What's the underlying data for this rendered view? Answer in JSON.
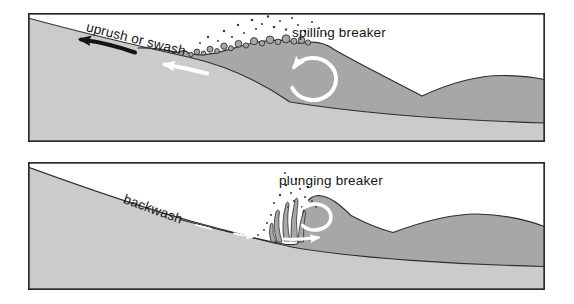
{
  "colors": {
    "background": "#ffffff",
    "water": "#a7a7a7",
    "sand": "#cbcbcb",
    "outline": "#2f2f2f",
    "frame": "#2b2b2b",
    "text": "#141414",
    "arrow_black": "#141414",
    "arrow_white": "#ffffff",
    "spray": "#3b3b3b"
  },
  "panels": [
    {
      "id": "spilling-breaker-panel",
      "flow_label": "uprush or swash",
      "breaker_label": "spilling breaker",
      "arrows": [
        "black-uprush-arrow-pointing-left",
        "white-swash-arrow-pointing-left",
        "white-orbital-circulation-arrow"
      ]
    },
    {
      "id": "plunging-breaker-panel",
      "flow_label": "backwash",
      "breaker_label": "plunging breaker",
      "arrows": [
        "white-backwash-dashes-pointing-seaward",
        "white-plunge-circulation-arrow",
        "white-bed-return-arrow-pointing-right"
      ]
    }
  ]
}
